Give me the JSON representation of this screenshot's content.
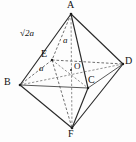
{
  "figure": {
    "kind": "regular-octahedron-diagram",
    "background_color": "#fdfdfd",
    "stroke_color": "#2b2b2b",
    "vertices": [
      {
        "name": "A",
        "label": "A",
        "x": 71,
        "y": 14,
        "label_x": 67,
        "label_y": 1,
        "role": "apex-top"
      },
      {
        "name": "B",
        "label": "B",
        "x": 20,
        "y": 85,
        "label_x": 5,
        "label_y": 78,
        "role": "left"
      },
      {
        "name": "C",
        "label": "C",
        "x": 88,
        "y": 88,
        "label_x": 88,
        "label_y": 76,
        "role": "front-right"
      },
      {
        "name": "D",
        "label": "D",
        "x": 123,
        "y": 64,
        "label_x": 125,
        "label_y": 57,
        "role": "right"
      },
      {
        "name": "E",
        "label": "E",
        "x": 52,
        "y": 60,
        "label_x": 42,
        "label_y": 50,
        "role": "back-left"
      },
      {
        "name": "F",
        "label": "F",
        "x": 72,
        "y": 128,
        "label_x": 69,
        "label_y": 130,
        "role": "apex-bottom"
      },
      {
        "name": "O",
        "label": "O",
        "x": 71,
        "y": 70,
        "label_x": 75,
        "label_y": 63,
        "role": "center"
      }
    ],
    "measurements": [
      {
        "name": "slant-edge",
        "text": "2a",
        "prefix": "√",
        "x": 20,
        "y": 29,
        "describes": "edge A to B"
      },
      {
        "name": "half-diagonal-vertical",
        "text": "a",
        "x": 64,
        "y": 37,
        "describes": "segment A to O"
      },
      {
        "name": "half-diagonal-horizontal",
        "text": "a",
        "x": 40,
        "y": 65,
        "describes": "segment O to B"
      }
    ],
    "edges_solid": [
      {
        "name": "edge-A-B",
        "from": "A",
        "to": "B"
      },
      {
        "name": "edge-A-D",
        "from": "A",
        "to": "D"
      },
      {
        "name": "edge-A-C",
        "from": "A",
        "to": "C"
      },
      {
        "name": "edge-B-F",
        "from": "B",
        "to": "F"
      },
      {
        "name": "edge-D-F",
        "from": "D",
        "to": "F"
      },
      {
        "name": "edge-C-F",
        "from": "C",
        "to": "F"
      },
      {
        "name": "edge-B-C",
        "from": "B",
        "to": "C"
      },
      {
        "name": "edge-C-D",
        "from": "C",
        "to": "D"
      }
    ],
    "edges_dashed": [
      {
        "name": "edge-A-E",
        "from": "A",
        "to": "E"
      },
      {
        "name": "edge-E-B",
        "from": "E",
        "to": "B"
      },
      {
        "name": "edge-E-D",
        "from": "E",
        "to": "D"
      },
      {
        "name": "edge-E-F",
        "from": "E",
        "to": "F"
      },
      {
        "name": "edge-E-C",
        "from": "E",
        "to": "C"
      },
      {
        "name": "diagonal-B-D",
        "from": "B",
        "to": "D"
      },
      {
        "name": "diagonal-A-F",
        "from": "A",
        "to": "F"
      }
    ]
  }
}
